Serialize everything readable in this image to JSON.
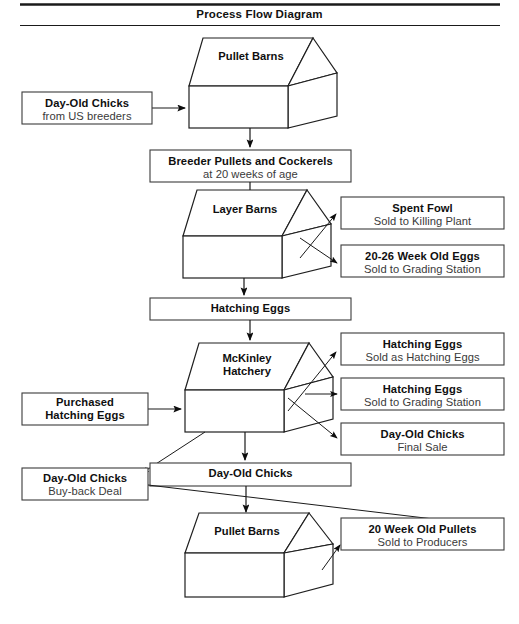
{
  "header": {
    "title": "Process Flow Diagram"
  },
  "nodes": {
    "day_old_chicks_us": {
      "line1": "Day-Old Chicks",
      "line2": "from US breeders"
    },
    "pullet_barns_top": {
      "label": "Pullet Barns"
    },
    "breeder_pullets": {
      "line1": "Breeder Pullets and Cockerels",
      "line2": "at 20 weeks of age"
    },
    "layer_barns": {
      "label": "Layer Barns"
    },
    "spent_fowl": {
      "line1": "Spent Fowl",
      "line2": "Sold to Killing Plant"
    },
    "week_old_eggs": {
      "line1": "20-26 Week Old Eggs",
      "line2": "Sold to Grading Station"
    },
    "hatching_eggs": {
      "line1": "Hatching Eggs"
    },
    "mckinley_hatchery": {
      "line1": "McKinley",
      "line2": "Hatchery"
    },
    "purchased_hatching_eggs": {
      "line1": "Purchased",
      "line2": "Hatching Eggs"
    },
    "hatching_eggs_sold_as": {
      "line1": "Hatching Eggs",
      "line2": "Sold as Hatching Eggs"
    },
    "hatching_eggs_grading": {
      "line1": "Hatching Eggs",
      "line2": "Sold to Grading Station"
    },
    "day_old_chicks_final": {
      "line1": "Day-Old Chicks",
      "line2": "Final Sale"
    },
    "day_old_chicks_buyback": {
      "line1": "Day-Old Chicks",
      "line2": "Buy-back Deal"
    },
    "day_old_chicks_mid": {
      "line1": "Day-Old Chicks"
    },
    "pullet_barns_bottom": {
      "label": "Pullet Barns"
    },
    "week_old_pullets": {
      "line1": "20 Week Old Pullets",
      "line2": "Sold to Producers"
    }
  },
  "colors": {
    "stroke": "#1a1a1a",
    "box_stroke": "#3b3b3b",
    "text_bold": "#0f0f0f",
    "text_regular": "#3a3a3a",
    "background": "#ffffff"
  }
}
